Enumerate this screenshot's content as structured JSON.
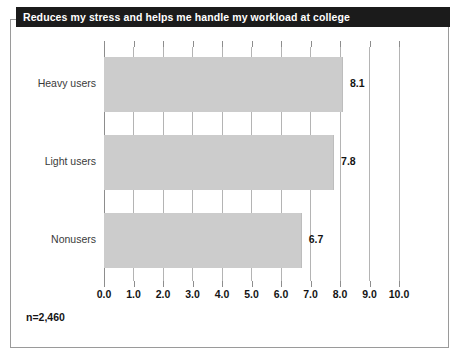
{
  "chart_data": {
    "type": "bar",
    "orientation": "horizontal",
    "title": "Reduces my stress and helps me handle my workload at college",
    "categories": [
      "Heavy users",
      "Light users",
      "Nonusers"
    ],
    "values": [
      8.1,
      7.8,
      6.7
    ],
    "value_labels": [
      "8.1",
      "7.8",
      "6.7"
    ],
    "xlabel": "",
    "ylabel": "",
    "xlim": [
      0.0,
      10.0
    ],
    "xticks": [
      0.0,
      1.0,
      2.0,
      3.0,
      4.0,
      5.0,
      6.0,
      7.0,
      8.0,
      9.0,
      10.0
    ],
    "xtick_labels": [
      "0.0",
      "1.0",
      "2.0",
      "3.0",
      "4.0",
      "5.0",
      "6.0",
      "7.0",
      "8.0",
      "9.0",
      "10.0"
    ],
    "grid": true,
    "grid_axis": "x",
    "legend": null,
    "footnote": "n=2,460",
    "colors": {
      "bar_fill": "#cccccc",
      "gridline": "#b4b4b4",
      "title_background": "#1b1b1b",
      "title_text": "#ffffff",
      "frame_border": "#9a9a9a",
      "text": "#141414"
    }
  }
}
